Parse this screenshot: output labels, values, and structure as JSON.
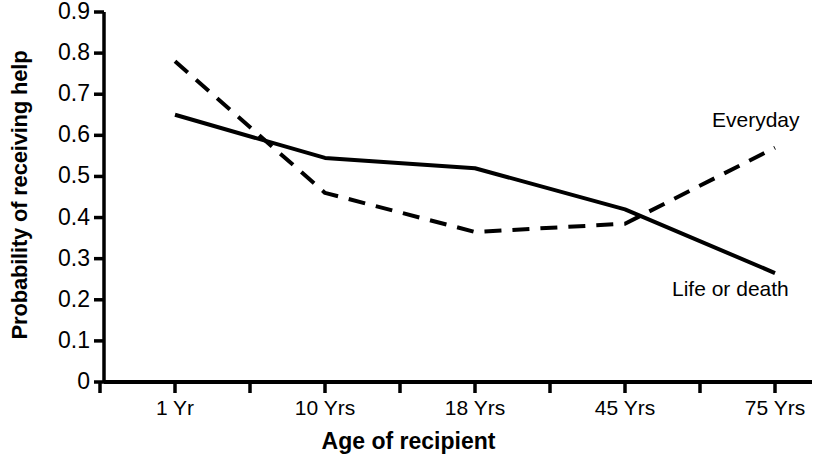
{
  "chart_data": {
    "type": "line",
    "title": "",
    "subtitle": "",
    "xlabel": "Age of recipient",
    "ylabel": "Probability of receiving help",
    "categories": [
      "1 Yr",
      "10 Yrs",
      "18 Yrs",
      "45 Yrs",
      "75 Yrs"
    ],
    "ylim": [
      0,
      0.9
    ],
    "ytick_labels": [
      "0.9",
      "0.8",
      "0.7",
      "0.6",
      "0.5",
      "0.4",
      "0.3",
      "0.2",
      "0.1",
      "0"
    ],
    "ytick_values": [
      0.9,
      0.8,
      0.7,
      0.6,
      0.5,
      0.4,
      0.3,
      0.2,
      0.1,
      0
    ],
    "grid": false,
    "legend_position": "inline-right-annotations",
    "series": [
      {
        "name": "Everyday",
        "style": "dashed",
        "color": "#000000",
        "values": [
          0.78,
          0.46,
          0.365,
          0.385,
          0.57
        ]
      },
      {
        "name": "Life or death",
        "style": "solid",
        "color": "#000000",
        "values": [
          0.65,
          0.545,
          0.52,
          0.42,
          0.265
        ]
      }
    ],
    "annotations": [
      {
        "text": "Everyday",
        "series": "Everyday"
      },
      {
        "text": "Life or death",
        "series": "Life or death"
      }
    ]
  },
  "axis": {
    "line_color": "#000000",
    "minor_ticks_on_x": true
  }
}
